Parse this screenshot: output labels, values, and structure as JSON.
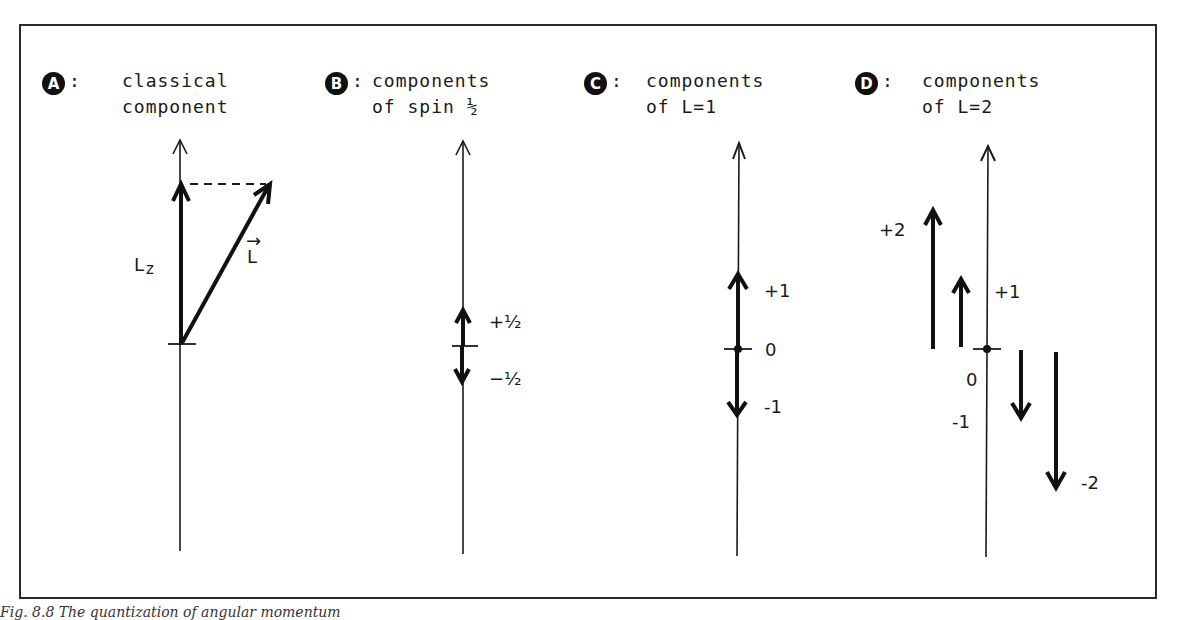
{
  "panels": [
    {
      "badge": "A",
      "title_line1": "classical",
      "title_line2": "component",
      "labels": {
        "lz": "L",
        "lz_sub": "z",
        "l_vec": "L",
        "l_vec_arrow": "→"
      }
    },
    {
      "badge": "B",
      "title_line1": "components",
      "title_line2": "of spin ½",
      "labels": {
        "plus_half": "+½",
        "minus_half": "−½"
      }
    },
    {
      "badge": "C",
      "title_line1": "components",
      "title_line2": "of L=1",
      "labels": {
        "plus_one": "+1",
        "zero": "0",
        "minus_one": "-1"
      }
    },
    {
      "badge": "D",
      "title_line1": "components",
      "title_line2": "of L=2",
      "labels": {
        "plus_two": "+2",
        "plus_one": "+1",
        "zero": "0",
        "minus_one": "-1",
        "minus_two": "-2"
      }
    }
  ],
  "caption": "Fig. 8.8  The quantization of angular momentum"
}
